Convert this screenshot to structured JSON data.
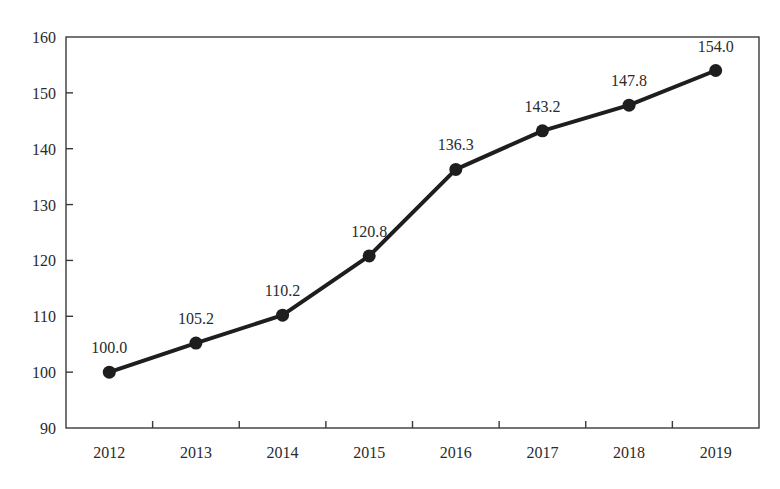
{
  "chart_data": {
    "type": "line",
    "title": "",
    "xlabel": "",
    "ylabel": "",
    "categories": [
      "2012",
      "2013",
      "2014",
      "2015",
      "2016",
      "2017",
      "2018",
      "2019"
    ],
    "series": [
      {
        "name": "Index",
        "values": [
          100.0,
          105.2,
          110.2,
          120.8,
          136.3,
          143.2,
          147.8,
          154.0
        ],
        "data_labels": [
          "100.0",
          "105.2",
          "110.2",
          "120.8",
          "136.3",
          "143.2",
          "147.8",
          "154.0"
        ],
        "color": "#1e1e1e",
        "marker": "circle"
      }
    ],
    "ylim": [
      90,
      160
    ],
    "yticks": [
      90,
      100,
      110,
      120,
      130,
      140,
      150,
      160
    ],
    "grid": false,
    "legend": "none"
  },
  "colors": {
    "line": "#1e1e1e",
    "axis": "#3a3a3a",
    "text": "#2b2b2b",
    "background": "#ffffff"
  }
}
